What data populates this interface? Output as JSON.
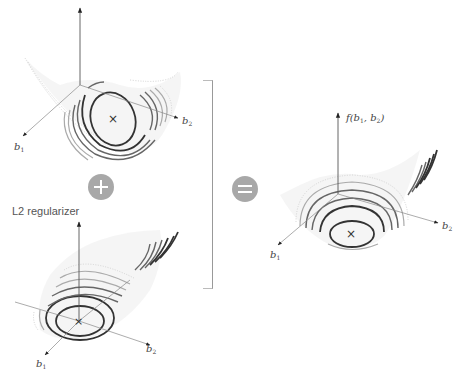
{
  "diagram": {
    "type": "equation-of-surfaces",
    "panels": [
      {
        "id": "loss-surface",
        "position": "top-left",
        "axes": {
          "vertical": "",
          "b1": "b",
          "b1_sub": "1",
          "b2": "b",
          "b2_sub": "2"
        },
        "minimum_marker": "×"
      },
      {
        "id": "l2-regularizer",
        "position": "bottom-left",
        "title": "L2 regularizer",
        "axes": {
          "vertical": "",
          "b1": "b",
          "b1_sub": "1",
          "b2": "b",
          "b2_sub": "2"
        },
        "minimum_marker": "×"
      },
      {
        "id": "combined-surface",
        "position": "right",
        "axes": {
          "vertical": "f(b",
          "vertical_sub1": "1",
          "vertical_mid": ", b",
          "vertical_sub2": "2",
          "vertical_end": ")",
          "b1": "b",
          "b1_sub": "1",
          "b2": "b",
          "b2_sub": "2"
        },
        "minimum_marker": "×"
      }
    ],
    "operators": {
      "plus": "plus-icon",
      "equals": "equals-icon"
    },
    "colors": {
      "operator_fill": "#a8a8a8",
      "contour_dark": "#333333",
      "axis": "#555555"
    }
  }
}
